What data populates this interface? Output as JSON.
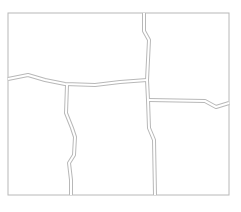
{
  "diagram": {
    "type": "parcel-map",
    "colors": {
      "line": "#b8b8b8",
      "background": "#ffffff"
    },
    "boundary": {
      "x": 8,
      "y": 13,
      "width": 221,
      "height": 182
    },
    "regions": [
      {
        "id": "top-left"
      },
      {
        "id": "top-right"
      },
      {
        "id": "bottom-left"
      },
      {
        "id": "bottom-middle"
      },
      {
        "id": "bottom-right"
      }
    ],
    "roads": [
      {
        "id": "upper-vertical",
        "points": "144,13 144,31 149,40 148,60 147,80"
      },
      {
        "id": "left-horizontal",
        "points": "8,79 28,75 45,80 65,84 95,85 120,82 147,80"
      },
      {
        "id": "lower-vertical",
        "points": "147,80 148,100 149,128 154,140 155,195"
      },
      {
        "id": "right-horizontal",
        "points": "149,100 205,101 216,107 229,103"
      },
      {
        "id": "lower-left-vertical",
        "points": "67,85 66,113 72,128 75,137 74,155 69,163 71,180 71,195"
      }
    ]
  }
}
